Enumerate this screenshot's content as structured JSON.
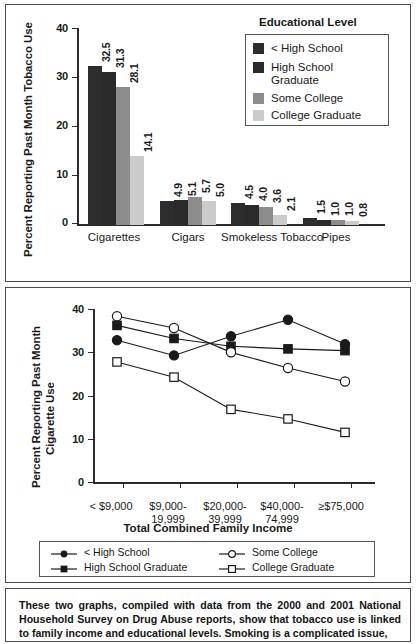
{
  "chart_data": [
    {
      "type": "bar",
      "title": "",
      "xlabel": "",
      "ylabel": "Percent Reporting Past Month Tobacco Use",
      "ylim": [
        0,
        40
      ],
      "yticks": [
        "0",
        "10",
        "20",
        "30",
        "40"
      ],
      "grid": false,
      "legend_title": "Educational Level",
      "legend_position": "top-right",
      "categories": [
        "Cigarettes",
        "Cigars",
        "Smokeless\nTobacco",
        "Pipes"
      ],
      "series": [
        {
          "name": "< High School",
          "color": "#2d2d2d",
          "values": [
            32.5,
            4.9,
            4.5,
            1.5
          ]
        },
        {
          "name": "High School\nGraduate",
          "color": "#2a2a2a",
          "values": [
            31.3,
            5.1,
            4.0,
            1.0
          ]
        },
        {
          "name": "Some College",
          "color": "#8c8c8c",
          "values": [
            28.1,
            5.7,
            3.6,
            1.0
          ]
        },
        {
          "name": "College Graduate",
          "color": "#cbcbcb",
          "values": [
            14.1,
            5.0,
            2.1,
            0.8
          ]
        }
      ],
      "value_labels": [
        [
          "32.5",
          "31.3",
          "28.1",
          "14.1"
        ],
        [
          "4.9",
          "5.1",
          "5.7",
          "5.0"
        ],
        [
          "4.5",
          "4.0",
          "3.6",
          "2.1"
        ],
        [
          "1.5",
          "1.0",
          "1.0",
          "0.8"
        ]
      ]
    },
    {
      "type": "line",
      "title": "",
      "xlabel": "Total Combined Family Income",
      "ylabel": "Percent Reporting Past Month Cigarette Use",
      "ylim": [
        0,
        40
      ],
      "yticks": [
        "0",
        "10",
        "20",
        "30",
        "40"
      ],
      "grid": false,
      "legend_position": "bottom",
      "categories": [
        "< $9,000",
        "$9,000-\n19,999",
        "$20,000-\n39,999",
        "$40,000-\n74,999",
        "≥$75,000"
      ],
      "series": [
        {
          "name": "< High School",
          "marker": "filled-circle",
          "values": [
            32.6,
            29.1,
            33.5,
            37.3,
            31.7
          ]
        },
        {
          "name": "High School Graduate",
          "marker": "filled-square",
          "values": [
            36.0,
            33.0,
            31.2,
            30.6,
            30.2
          ]
        },
        {
          "name": "Some College",
          "marker": "open-circle",
          "values": [
            38.1,
            35.4,
            29.8,
            26.2,
            23.1
          ]
        },
        {
          "name": "College Graduate",
          "marker": "open-square",
          "values": [
            27.6,
            24.1,
            16.7,
            14.5,
            11.4
          ]
        }
      ]
    }
  ],
  "bar_chart": {
    "ylabel": "Percent Reporting Past Month Tobacco Use",
    "yticks": [
      "40",
      "30",
      "20",
      "10",
      "0"
    ],
    "legend": {
      "title": "Educational Level",
      "items": [
        {
          "label": "< High School"
        },
        {
          "label": "High School\nGraduate"
        },
        {
          "label": "Some College"
        },
        {
          "label": "College Graduate"
        }
      ]
    },
    "groups": [
      {
        "label": "Cigarettes",
        "labels": [
          "32.5",
          "31.3",
          "28.1",
          "14.1"
        ]
      },
      {
        "label": "Cigars",
        "labels": [
          "4.9",
          "5.1",
          "5.7",
          "5.0"
        ]
      },
      {
        "label": "Smokeless\nTobacco",
        "labels": [
          "4.5",
          "4.0",
          "3.6",
          "2.1"
        ]
      },
      {
        "label": "Pipes",
        "labels": [
          "1.5",
          "1.0",
          "1.0",
          "0.8"
        ]
      }
    ]
  },
  "line_chart": {
    "ylabel": "Percent Reporting Past Month\nCigarette Use",
    "ylabel_line1": "Percent Reporting Past Month",
    "ylabel_line2": "Cigarette Use",
    "yticks": [
      "40",
      "30",
      "20",
      "10",
      "0"
    ],
    "xaxis_title": "Total Combined Family Income",
    "xcats": [
      "< $9,000",
      "$9,000-\n19,999",
      "$20,000-\n39,999",
      "$40,000-\n74,999",
      "≥$75,000"
    ],
    "legend": {
      "items": [
        {
          "label": "< High School",
          "marker": "filled-circle"
        },
        {
          "label": "High School Graduate",
          "marker": "filled-square"
        },
        {
          "label": "Some College",
          "marker": "open-circle"
        },
        {
          "label": "College Graduate",
          "marker": "open-square"
        }
      ]
    }
  },
  "caption": {
    "text": "These two graphs, compiled with data from the 2000 and 2001 National Household Survey on Drug Abuse reports, show that tobacco use is linked to family income and educational levels. Smoking is a complicated issue,"
  },
  "colors": {
    "series1": "#2d2d2d",
    "series2": "#2a2a2a",
    "series3": "#8c8c8c",
    "series4": "#cbcbcb",
    "axis": "#2b2b2b",
    "border": "#4a4a4a"
  }
}
